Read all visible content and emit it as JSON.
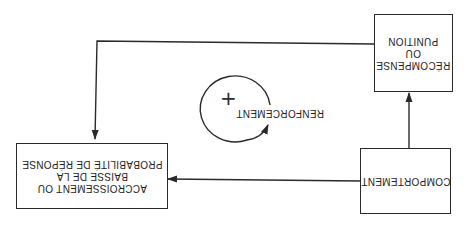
{
  "diagram": {
    "orientation": "rotated 180 degrees",
    "nodes": {
      "behavior": {
        "lines": [
          "COMPORTEMENT"
        ]
      },
      "consequence": {
        "lines": [
          "RÉCOMPENSE",
          "OU",
          "PUNITION"
        ]
      },
      "outcome": {
        "lines": [
          "ACCROISSEMENT OU",
          "BAISSE DE LA",
          "PROBABILITÉ DE RÉPONSE"
        ]
      }
    },
    "cycle": {
      "label": "RENFORCEMENT",
      "symbol": "+"
    },
    "edges": [
      {
        "from": "behavior",
        "to": "consequence"
      },
      {
        "from": "consequence",
        "to": "outcome"
      },
      {
        "from": "behavior",
        "to": "outcome"
      }
    ],
    "colors": {
      "line": "#2a2a2a",
      "background": "#ffffff"
    }
  }
}
